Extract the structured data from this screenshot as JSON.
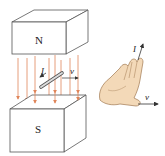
{
  "diagram": {
    "magnet_top": {
      "label": "N"
    },
    "magnet_bottom": {
      "label": "S"
    },
    "conductor": {
      "current_label": "I",
      "velocity_label": "v"
    },
    "hand": {
      "current_label": "I",
      "velocity_label": "v"
    },
    "colors": {
      "field_lines": "#e0855a",
      "outline": "#555555",
      "hand_skin": "#f3d9b8",
      "hand_outline": "#a07850",
      "arrow": "#333333"
    }
  }
}
